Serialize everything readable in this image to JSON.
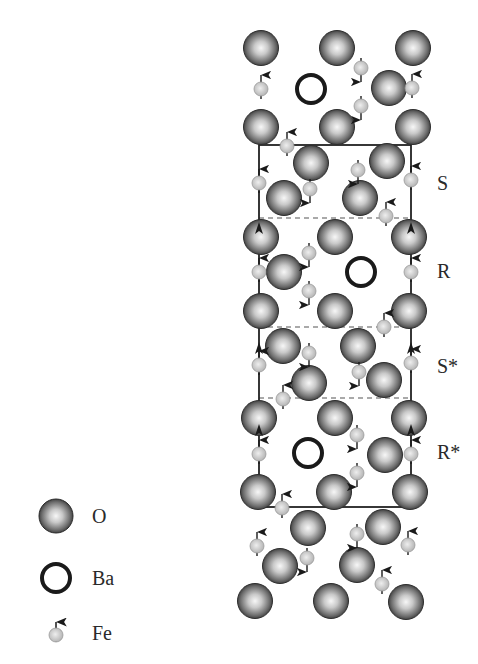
{
  "diagram": {
    "colors": {
      "oxygen_dark": "#2e2e2e",
      "oxygen_light": "#f4f4f4",
      "barium_ring": "#1a1a1a",
      "iron_fill": "#c8c8c8",
      "frame": "#222222",
      "dashed": "#555555",
      "arrow": "#1a1a1a",
      "label": "#2a2a2a"
    },
    "block_labels": [
      {
        "text": "S",
        "x": 437,
        "y": 190
      },
      {
        "text": "R",
        "x": 437,
        "y": 278
      },
      {
        "text": "S*",
        "x": 437,
        "y": 373
      },
      {
        "text": "R*",
        "x": 437,
        "y": 459
      }
    ],
    "frame": {
      "x1": 259,
      "y1": 145,
      "x2": 411,
      "y2": 507
    },
    "dashed_lines": [
      218,
      327,
      398
    ],
    "vertical_arrows": [
      {
        "x": 259,
        "y_positions": [
          228,
          348,
          430
        ]
      },
      {
        "x": 411,
        "y_positions": [
          228,
          348,
          430
        ]
      }
    ],
    "oxygen_atoms": [
      [
        261,
        48
      ],
      [
        337,
        48
      ],
      [
        413,
        48
      ],
      [
        389,
        88
      ],
      [
        261,
        127
      ],
      [
        337,
        127
      ],
      [
        413,
        127
      ],
      [
        311,
        163
      ],
      [
        387,
        161
      ],
      [
        284,
        198
      ],
      [
        360,
        198
      ],
      [
        261,
        237
      ],
      [
        335,
        237
      ],
      [
        409,
        237
      ],
      [
        284,
        272
      ],
      [
        261,
        311
      ],
      [
        335,
        311
      ],
      [
        409,
        311
      ],
      [
        283,
        346
      ],
      [
        358,
        346
      ],
      [
        309,
        383
      ],
      [
        384,
        380
      ],
      [
        259,
        418
      ],
      [
        335,
        418
      ],
      [
        409,
        418
      ],
      [
        385,
        455
      ],
      [
        258,
        492
      ],
      [
        334,
        492
      ],
      [
        410,
        492
      ],
      [
        308,
        528
      ],
      [
        383,
        527
      ],
      [
        280,
        566
      ],
      [
        357,
        565
      ],
      [
        255,
        601
      ],
      [
        331,
        601
      ],
      [
        406,
        602
      ]
    ],
    "barium_atoms": [
      [
        311,
        89
      ],
      [
        361,
        272
      ],
      [
        308,
        453
      ]
    ],
    "iron_atoms": [
      {
        "x": 261,
        "y": 89,
        "spin": "up"
      },
      {
        "x": 361,
        "y": 68,
        "spin": "down"
      },
      {
        "x": 361,
        "y": 106,
        "spin": "down"
      },
      {
        "x": 412,
        "y": 88,
        "spin": "up"
      },
      {
        "x": 287,
        "y": 146,
        "spin": "up"
      },
      {
        "x": 259,
        "y": 183,
        "spin": "up"
      },
      {
        "x": 310,
        "y": 189,
        "spin": "down"
      },
      {
        "x": 358,
        "y": 170,
        "spin": "down"
      },
      {
        "x": 411,
        "y": 180,
        "spin": "up"
      },
      {
        "x": 386,
        "y": 216,
        "spin": "up"
      },
      {
        "x": 259,
        "y": 272,
        "spin": "up"
      },
      {
        "x": 309,
        "y": 253,
        "spin": "down"
      },
      {
        "x": 309,
        "y": 291,
        "spin": "down"
      },
      {
        "x": 411,
        "y": 272,
        "spin": "up"
      },
      {
        "x": 384,
        "y": 327,
        "spin": "up"
      },
      {
        "x": 259,
        "y": 365,
        "spin": "up"
      },
      {
        "x": 309,
        "y": 353,
        "spin": "down"
      },
      {
        "x": 359,
        "y": 372,
        "spin": "down"
      },
      {
        "x": 411,
        "y": 363,
        "spin": "up"
      },
      {
        "x": 283,
        "y": 399,
        "spin": "up"
      },
      {
        "x": 259,
        "y": 454,
        "spin": "up"
      },
      {
        "x": 357,
        "y": 435,
        "spin": "down"
      },
      {
        "x": 357,
        "y": 473,
        "spin": "down"
      },
      {
        "x": 411,
        "y": 454,
        "spin": "up"
      },
      {
        "x": 282,
        "y": 508,
        "spin": "up"
      },
      {
        "x": 257,
        "y": 546,
        "spin": "up"
      },
      {
        "x": 307,
        "y": 558,
        "spin": "down"
      },
      {
        "x": 357,
        "y": 534,
        "spin": "down"
      },
      {
        "x": 408,
        "y": 545,
        "spin": "up"
      },
      {
        "x": 382,
        "y": 584,
        "spin": "up"
      }
    ],
    "legend": [
      {
        "symbol": "oxygen",
        "label": "O",
        "x": 56,
        "y": 516
      },
      {
        "symbol": "barium",
        "label": "Ba",
        "x": 56,
        "y": 578
      },
      {
        "symbol": "iron",
        "label": "Fe",
        "x": 56,
        "y": 632
      }
    ]
  }
}
